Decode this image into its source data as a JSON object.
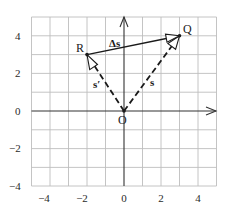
{
  "diagram": {
    "type": "vector-displacement-grid",
    "grid": {
      "x_min": -5,
      "x_max": 5,
      "y_min": -4,
      "y_max": 5,
      "step": 1
    },
    "x_ticks": [
      "−4",
      "−2",
      "0",
      "2",
      "4"
    ],
    "x_tick_values": [
      -4,
      -2,
      0,
      2,
      4
    ],
    "y_ticks": [
      "4",
      "2",
      "0",
      "−2",
      "−4"
    ],
    "y_tick_values": [
      4,
      2,
      0,
      -2,
      -4
    ],
    "points": {
      "O": {
        "label": "O",
        "x": 0,
        "y": 0
      },
      "R": {
        "label": "R",
        "x": -2,
        "y": 3
      },
      "Q": {
        "label": "Q",
        "x": 3,
        "y": 4
      }
    },
    "vectors": [
      {
        "name": "s",
        "label": "s",
        "from": "O",
        "to": "Q",
        "style": "dashed"
      },
      {
        "name": "s-prime",
        "label": "s′",
        "from": "O",
        "to": "R",
        "style": "dashed"
      },
      {
        "name": "delta-s",
        "label": "Δs",
        "from": "R",
        "to": "Q",
        "style": "solid"
      }
    ],
    "colors": {
      "grid": "#b8b8b8",
      "axis": "#333333",
      "vector": "#1a1a1a",
      "text": "#2a2a2a"
    }
  }
}
